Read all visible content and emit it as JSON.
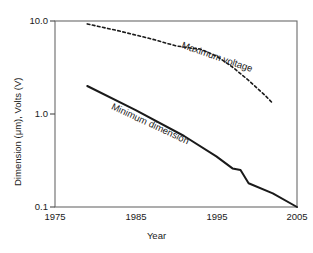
{
  "chart_data": {
    "type": "line",
    "title": "",
    "xlabel": "Year",
    "ylabel": "Dimension (μm), Volts (V)",
    "xlim": [
      1975,
      2005
    ],
    "ylim": [
      0.1,
      10.0
    ],
    "yscale": "log",
    "xscale": "linear",
    "grid": false,
    "legend": "inline-annotations",
    "xticks": [
      "1975",
      "1985",
      "1995",
      "2005"
    ],
    "xtick_values": [
      1975,
      1985,
      1995,
      2005
    ],
    "yticks": [
      "10.0",
      "1.0",
      "0.1"
    ],
    "ytick_values": [
      10.0,
      1.0,
      0.1
    ],
    "series": [
      {
        "name": "Maximum voltage",
        "style": "dashed",
        "color": "#1a1a1a",
        "x": [
          1979,
          1983,
          1987,
          1990,
          1992,
          1993,
          1995,
          1997,
          1999,
          2001,
          2002
        ],
        "values": [
          9.3,
          7.8,
          6.4,
          5.4,
          5.1,
          5.0,
          4.2,
          3.2,
          2.3,
          1.6,
          1.3
        ]
      },
      {
        "name": "Minimum dimension",
        "style": "solid",
        "color": "#1a1a1a",
        "x": [
          1979,
          1985,
          1991,
          1995,
          1997,
          1998,
          1999,
          2002,
          2005
        ],
        "values": [
          2.0,
          1.1,
          0.58,
          0.35,
          0.26,
          0.25,
          0.18,
          0.14,
          0.1
        ]
      }
    ],
    "annotations": [
      {
        "text": "Maximum voltage",
        "rotation_deg": 19
      },
      {
        "text": "Minimum dimension",
        "rotation_deg": 25
      }
    ]
  }
}
